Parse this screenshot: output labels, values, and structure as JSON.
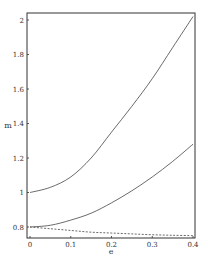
{
  "chart_data": {
    "type": "line",
    "title": "",
    "xlabel": "e",
    "ylabel": "m",
    "xlim": [
      0,
      0.4
    ],
    "ylim": [
      0.74,
      2.04
    ],
    "grid": false,
    "legend": null,
    "x_ticks": [
      "0",
      "0.1",
      "0.2",
      "0.3",
      "0.4"
    ],
    "y_ticks": [
      "0.8",
      "1",
      "1.2",
      "1.4",
      "1.6",
      "1.8",
      "2"
    ],
    "x": [
      0,
      0.05,
      0.1,
      0.15,
      0.2,
      0.25,
      0.3,
      0.35,
      0.4
    ],
    "series": [
      {
        "name": "upper-solid",
        "style": "solid",
        "values": [
          1.0,
          1.03,
          1.09,
          1.2,
          1.35,
          1.5,
          1.66,
          1.84,
          2.02
        ]
      },
      {
        "name": "middle-solid",
        "style": "solid",
        "values": [
          0.8,
          0.81,
          0.84,
          0.88,
          0.94,
          1.01,
          1.09,
          1.18,
          1.28
        ]
      },
      {
        "name": "lower-dashed",
        "style": "dashed",
        "values": [
          0.8,
          0.79,
          0.78,
          0.77,
          0.765,
          0.76,
          0.755,
          0.752,
          0.75
        ]
      }
    ]
  }
}
